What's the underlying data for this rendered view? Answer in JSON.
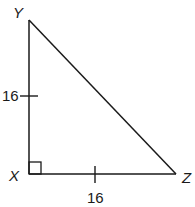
{
  "diagram": {
    "type": "right-triangle",
    "vertices": {
      "Y": {
        "label": "Y",
        "x": 29,
        "y": 20
      },
      "X": {
        "label": "X",
        "x": 29,
        "y": 174
      },
      "Z": {
        "label": "Z",
        "x": 176,
        "y": 174
      }
    },
    "sides": {
      "XY": {
        "length_label": "16",
        "tick": true
      },
      "XZ": {
        "length_label": "16",
        "tick": true
      },
      "YZ": {
        "length_label": "",
        "tick": false
      }
    },
    "right_angle_at": "X",
    "stroke_color": "#1a1a1a"
  }
}
